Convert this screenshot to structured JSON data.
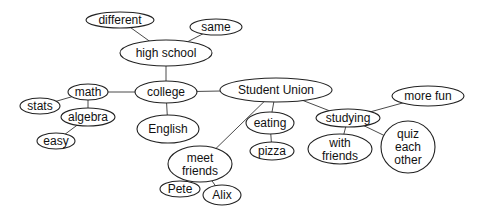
{
  "diagram": {
    "type": "concept-map",
    "colors": {
      "background": "#ffffff",
      "stroke": "#222222",
      "edge": "#4a4a4a",
      "text": "#111111"
    },
    "nodes": [
      {
        "id": "different",
        "label": "different",
        "lines": [
          "different"
        ],
        "cx": 120,
        "cy": 20,
        "rx": 34,
        "ry": 8
      },
      {
        "id": "same",
        "label": "same",
        "lines": [
          "same"
        ],
        "cx": 216,
        "cy": 27,
        "rx": 26,
        "ry": 8
      },
      {
        "id": "high-school",
        "label": "high school",
        "lines": [
          "high school"
        ],
        "cx": 166,
        "cy": 53,
        "rx": 46,
        "ry": 13
      },
      {
        "id": "college",
        "label": "college",
        "lines": [
          "college"
        ],
        "cx": 166,
        "cy": 92,
        "rx": 31,
        "ry": 11
      },
      {
        "id": "math",
        "label": "math",
        "lines": [
          "math"
        ],
        "cx": 88,
        "cy": 92,
        "rx": 20,
        "ry": 8
      },
      {
        "id": "stats",
        "label": "stats",
        "lines": [
          "stats"
        ],
        "cx": 40,
        "cy": 106,
        "rx": 20,
        "ry": 8
      },
      {
        "id": "algebra",
        "label": "algebra",
        "lines": [
          "algebra"
        ],
        "cx": 88,
        "cy": 117,
        "rx": 27,
        "ry": 9
      },
      {
        "id": "easy",
        "label": "easy",
        "lines": [
          "easy"
        ],
        "cx": 56,
        "cy": 141,
        "rx": 19,
        "ry": 8
      },
      {
        "id": "english",
        "label": "English",
        "lines": [
          "English"
        ],
        "cx": 168,
        "cy": 129,
        "rx": 31,
        "ry": 14
      },
      {
        "id": "student-union",
        "label": "Student Union",
        "lines": [
          "Student Union"
        ],
        "cx": 276,
        "cy": 90,
        "rx": 56,
        "ry": 12
      },
      {
        "id": "eating",
        "label": "eating",
        "lines": [
          "eating"
        ],
        "cx": 270,
        "cy": 123,
        "rx": 24,
        "ry": 11
      },
      {
        "id": "pizza",
        "label": "pizza",
        "lines": [
          "pizza"
        ],
        "cx": 272,
        "cy": 151,
        "rx": 22,
        "ry": 9
      },
      {
        "id": "meet-friends",
        "label": "meet friends",
        "lines": [
          "meet",
          "friends"
        ],
        "cx": 200,
        "cy": 164,
        "rx": 32,
        "ry": 18
      },
      {
        "id": "pete",
        "label": "Pete",
        "lines": [
          "Pete"
        ],
        "cx": 180,
        "cy": 189,
        "rx": 20,
        "ry": 8
      },
      {
        "id": "alix",
        "label": "Alix",
        "lines": [
          "Alix"
        ],
        "cx": 222,
        "cy": 195,
        "rx": 19,
        "ry": 10
      },
      {
        "id": "studying",
        "label": "studying",
        "lines": [
          "studying"
        ],
        "cx": 348,
        "cy": 118,
        "rx": 32,
        "ry": 9
      },
      {
        "id": "with-friends",
        "label": "with friends",
        "lines": [
          "with",
          "friends"
        ],
        "cx": 340,
        "cy": 149,
        "rx": 32,
        "ry": 15
      },
      {
        "id": "quiz-each-other",
        "label": "quiz each other",
        "lines": [
          "quiz",
          "each",
          "other"
        ],
        "cx": 408,
        "cy": 147,
        "rx": 27,
        "ry": 26
      },
      {
        "id": "more-fun",
        "label": "more fun",
        "lines": [
          "more fun"
        ],
        "cx": 428,
        "cy": 96,
        "rx": 36,
        "ry": 10
      }
    ],
    "edges": [
      {
        "from": "high-school",
        "to": "different"
      },
      {
        "from": "high-school",
        "to": "same"
      },
      {
        "from": "high-school",
        "to": "college"
      },
      {
        "from": "college",
        "to": "math"
      },
      {
        "from": "college",
        "to": "english"
      },
      {
        "from": "college",
        "to": "student-union"
      },
      {
        "from": "math",
        "to": "stats"
      },
      {
        "from": "math",
        "to": "algebra"
      },
      {
        "from": "algebra",
        "to": "easy"
      },
      {
        "from": "student-union",
        "to": "eating"
      },
      {
        "from": "student-union",
        "to": "meet-friends"
      },
      {
        "from": "student-union",
        "to": "studying"
      },
      {
        "from": "eating",
        "to": "pizza"
      },
      {
        "from": "meet-friends",
        "to": "pete"
      },
      {
        "from": "meet-friends",
        "to": "alix"
      },
      {
        "from": "studying",
        "to": "with-friends"
      },
      {
        "from": "studying",
        "to": "quiz-each-other"
      },
      {
        "from": "studying",
        "to": "more-fun"
      }
    ]
  }
}
